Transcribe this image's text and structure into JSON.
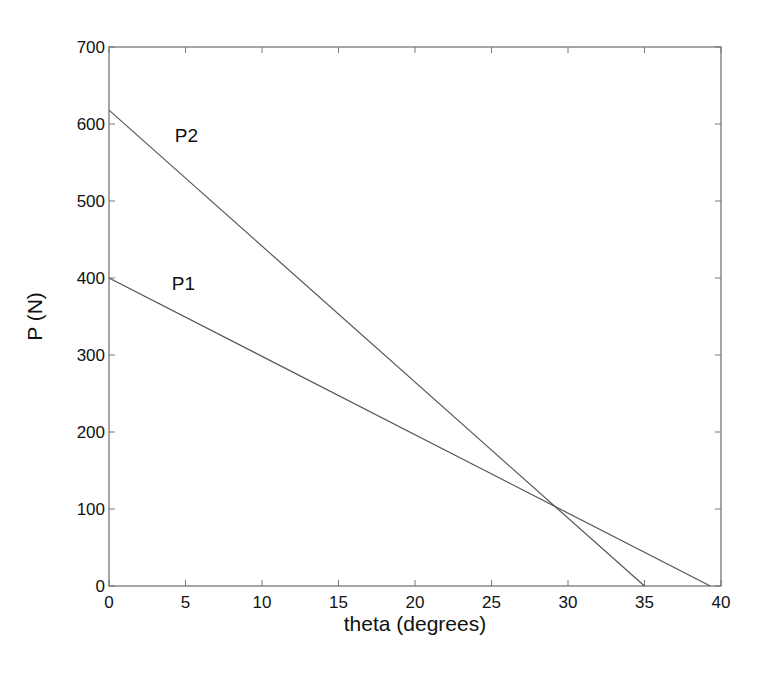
{
  "chart_data": {
    "type": "line",
    "title": "",
    "xlabel": "theta (degrees)",
    "ylabel": "P (N)",
    "xlim": [
      0,
      40
    ],
    "ylim": [
      0,
      700
    ],
    "xticks": [
      0,
      5,
      10,
      15,
      20,
      25,
      30,
      35,
      40
    ],
    "yticks": [
      0,
      100,
      200,
      300,
      400,
      500,
      600,
      700
    ],
    "grid": false,
    "legend": null,
    "series": [
      {
        "name": "P1",
        "x": [
          0,
          39.3
        ],
        "y": [
          400,
          0
        ],
        "color": "#555555"
      },
      {
        "name": "P2",
        "x": [
          0,
          35
        ],
        "y": [
          618,
          0
        ],
        "color": "#555555"
      }
    ],
    "annotations": [
      {
        "text": "P2",
        "x": 4.3,
        "y": 586
      },
      {
        "text": "P1",
        "x": 4.1,
        "y": 393
      }
    ],
    "intersection": {
      "x": 28.8,
      "y": 112
    }
  }
}
